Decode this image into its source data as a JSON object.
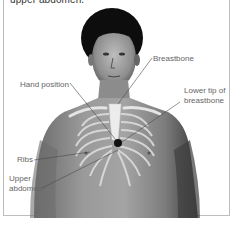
{
  "caption": "upper abdomen.",
  "labels": {
    "breastbone": "Breastbone",
    "hand_position": "Hand position",
    "lower_tip_line1": "Lower tip of",
    "lower_tip_line2": "breastbone",
    "ribs": "Ribs",
    "upper_abdomen_line1": "Upper",
    "upper_abdomen_line2": "abdomen"
  },
  "colors": {
    "skin_dark": "#4a4a4a",
    "skin_mid": "#8a8a8a",
    "bone": "#e8e8e8",
    "marker": "#111111",
    "label_text": "#666666",
    "border": "#bdbdbd"
  }
}
